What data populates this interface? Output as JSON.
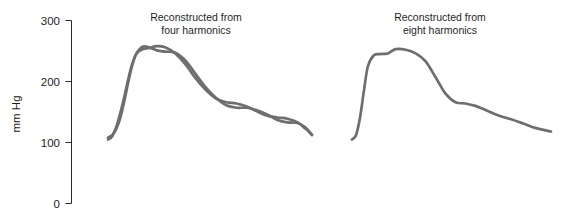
{
  "figure": {
    "background_color": "#ffffff",
    "trace_color": "#6e6e6e",
    "axis_color": "#2b2b2b"
  },
  "axis": {
    "y_label": "mm Hg",
    "tick_labels": [
      "300",
      "200",
      "100",
      "0"
    ],
    "tick_values": [
      300,
      200,
      100,
      0
    ],
    "ylim": [
      0,
      300
    ]
  },
  "panels": [
    {
      "title_line1": "Reconstructed from",
      "title_line2": "four harmonics"
    },
    {
      "title_line1": "Reconstructed from",
      "title_line2": "eight harmonics"
    }
  ],
  "chart_data": {
    "type": "line",
    "title": "",
    "subtitle": "",
    "xlabel": "",
    "ylabel": "mm Hg",
    "ylim": [
      0,
      300
    ],
    "yticks": [
      0,
      100,
      200,
      300
    ],
    "ytick_labels": [
      "0",
      "100",
      "200",
      "300"
    ],
    "grid": false,
    "legend": false,
    "legend_position": "none",
    "axis_style": "left-spine-only",
    "annotations": [
      {
        "text": "Reconstructed from four harmonics",
        "panel": 0
      },
      {
        "text": "Reconstructed from eight harmonics",
        "panel": 1
      }
    ],
    "panels": [
      {
        "name": "Reconstructed from four harmonics",
        "x_range": [
          0,
          1
        ],
        "series": [
          {
            "name": "original arterial pressure wave",
            "x": [
              0.0,
              0.02,
              0.04,
              0.06,
              0.08,
              0.1,
              0.12,
              0.14,
              0.17,
              0.2,
              0.24,
              0.28,
              0.33,
              0.38,
              0.43,
              0.48,
              0.53,
              0.58,
              0.63,
              0.68,
              0.73,
              0.78,
              0.83,
              0.88,
              0.93,
              0.97,
              1.0
            ],
            "values": [
              105,
              110,
              125,
              148,
              175,
              205,
              230,
              246,
              253,
              255,
              258,
              256,
              246,
              228,
              205,
              186,
              172,
              166,
              164,
              159,
              151,
              144,
              141,
              139,
              133,
              122,
              113
            ]
          },
          {
            "name": "four-harmonic reconstruction",
            "x": [
              0.0,
              0.02,
              0.04,
              0.06,
              0.08,
              0.1,
              0.12,
              0.14,
              0.17,
              0.2,
              0.24,
              0.28,
              0.33,
              0.38,
              0.43,
              0.48,
              0.53,
              0.58,
              0.63,
              0.68,
              0.73,
              0.78,
              0.83,
              0.88,
              0.93,
              0.97,
              1.0
            ],
            "values": [
              108,
              112,
              122,
              140,
              168,
              200,
              228,
              246,
              257,
              256,
              251,
              249,
              247,
              234,
              212,
              190,
              173,
              161,
              157,
              157,
              153,
              146,
              137,
              133,
              132,
              124,
              112
            ]
          }
        ]
      },
      {
        "name": "Reconstructed from eight harmonics",
        "x_range": [
          0,
          1
        ],
        "series": [
          {
            "name": "eight-harmonic reconstruction",
            "x": [
              0.0,
              0.02,
              0.04,
              0.06,
              0.08,
              0.11,
              0.14,
              0.18,
              0.22,
              0.27,
              0.32,
              0.37,
              0.42,
              0.47,
              0.52,
              0.57,
              0.62,
              0.68,
              0.74,
              0.8,
              0.86,
              0.92,
              1.0
            ],
            "values": [
              105,
              112,
              140,
              185,
              225,
              243,
              245,
              246,
              253,
              252,
              246,
              233,
              207,
              180,
              166,
              164,
              160,
              152,
              144,
              138,
              131,
              124,
              118
            ]
          }
        ]
      }
    ]
  }
}
